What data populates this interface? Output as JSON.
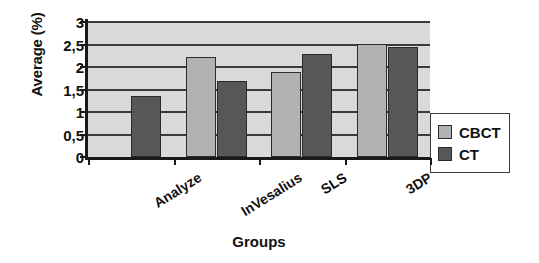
{
  "chart_data": {
    "type": "bar",
    "title": "",
    "xlabel": "Groups",
    "ylabel": "Average (%)",
    "categories": [
      "Analyze",
      "InVesalius",
      "SLS",
      "3DP"
    ],
    "series": [
      {
        "name": "CBCT",
        "color": "#b2b2b2",
        "values": [
          null,
          2.22,
          1.9,
          2.51
        ]
      },
      {
        "name": "CT",
        "color": "#575757",
        "values": [
          1.35,
          1.68,
          2.3,
          2.45
        ]
      }
    ],
    "ylim": [
      0,
      3
    ],
    "yticks": [
      "0",
      "0,5",
      "1",
      "1,5",
      "2",
      "2,5",
      "3"
    ],
    "ytick_values": [
      0,
      0.5,
      1,
      1.5,
      2,
      2.5,
      3
    ],
    "grid": true,
    "legend_position": "right",
    "plot_background": "#d9d9d9",
    "decimal_separator": ","
  },
  "legend": {
    "items": [
      {
        "label": "CBCT",
        "swatch": "cbct"
      },
      {
        "label": "CT",
        "swatch": "ct"
      }
    ]
  }
}
